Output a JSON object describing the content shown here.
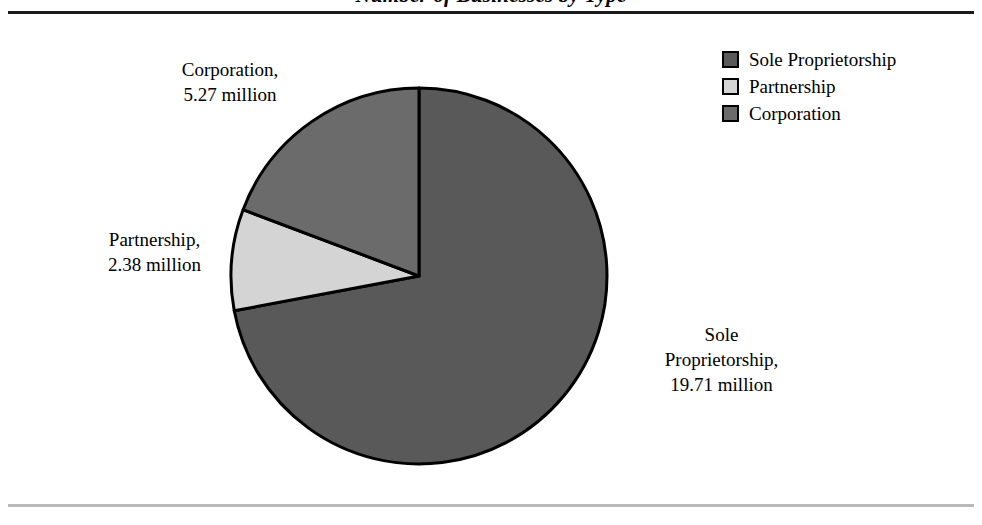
{
  "title": "Number of Businesses by Type",
  "rules": {
    "top_color": "#1a1a1a",
    "bottom_color": "#b9b9b9"
  },
  "legend": {
    "position": "top-right",
    "items": [
      {
        "label": "Sole Proprietorship",
        "color": "#595959"
      },
      {
        "label": "Partnership",
        "color": "#d4d4d4"
      },
      {
        "label": "Corporation",
        "color": "#6b6b6b"
      }
    ]
  },
  "callouts": {
    "corporation": {
      "line1": "Corporation,",
      "line2": "5.27 million"
    },
    "partnership": {
      "line1": "Partnership,",
      "line2": "2.38 million"
    },
    "sole": {
      "line1": "Sole",
      "line2": "Proprietorship,",
      "line3": "19.71 million"
    }
  },
  "chart_data": {
    "type": "pie",
    "title": "Number of Businesses by Type",
    "unit": "million",
    "categories": [
      "Sole Proprietorship",
      "Partnership",
      "Corporation"
    ],
    "values": [
      19.71,
      2.38,
      5.27
    ],
    "value_labels": [
      "19.71 million",
      "2.38 million",
      "5.27 million"
    ],
    "percentages": [
      72.0,
      8.7,
      19.3
    ],
    "colors": [
      "#595959",
      "#d4d4d4",
      "#6b6b6b"
    ],
    "start_angle_deg": 0,
    "direction": "clockwise",
    "stroke_color": "#000000",
    "legend_position": "top-right",
    "grid": false,
    "total": 27.36
  }
}
